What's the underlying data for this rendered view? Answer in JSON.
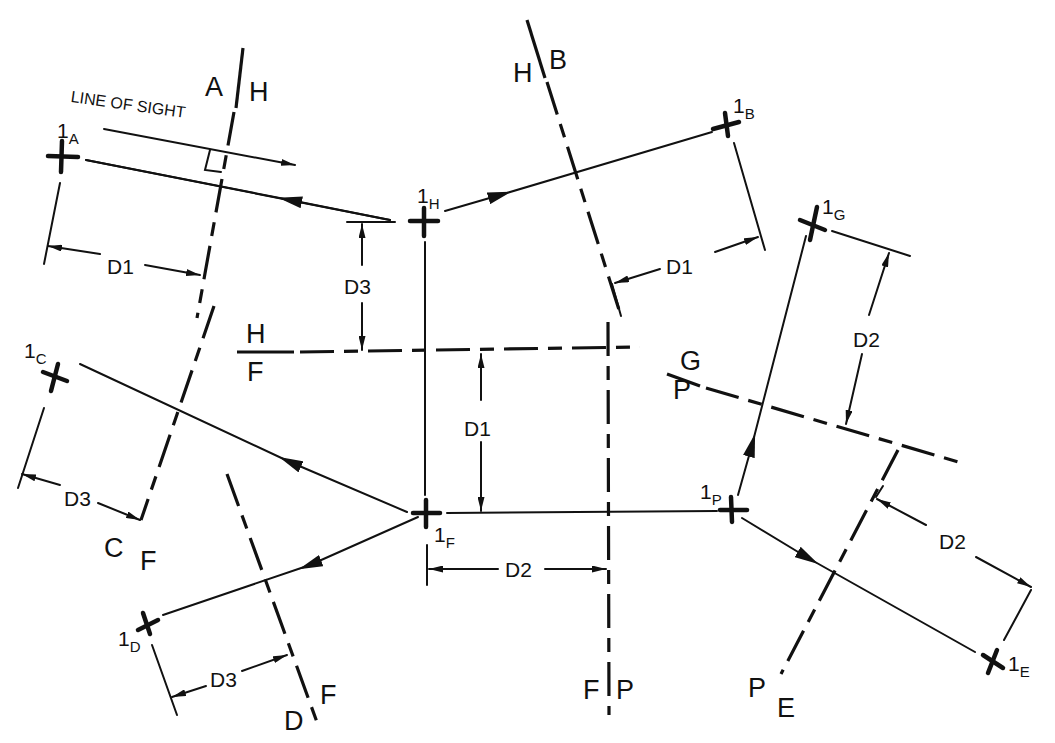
{
  "diagram": {
    "annotation": "LINE OF SIGHT",
    "fold_lines": [
      {
        "id": "A-H",
        "left": "A",
        "right": "H"
      },
      {
        "id": "H-B",
        "left": "H",
        "right": "B"
      },
      {
        "id": "H-F",
        "top": "H",
        "bottom": "F"
      },
      {
        "id": "C-F",
        "left": "C",
        "right": "F"
      },
      {
        "id": "D-F",
        "left": "D",
        "right": "F"
      },
      {
        "id": "F-P",
        "left": "F",
        "right": "P"
      },
      {
        "id": "G-P",
        "top": "G",
        "bottom": "P"
      },
      {
        "id": "P-E",
        "left": "P",
        "right": "E"
      }
    ],
    "points": [
      {
        "name": "1",
        "sub": "A"
      },
      {
        "name": "1",
        "sub": "H"
      },
      {
        "name": "1",
        "sub": "B"
      },
      {
        "name": "1",
        "sub": "G"
      },
      {
        "name": "1",
        "sub": "C"
      },
      {
        "name": "1",
        "sub": "F"
      },
      {
        "name": "1",
        "sub": "P"
      },
      {
        "name": "1",
        "sub": "D"
      },
      {
        "name": "1",
        "sub": "E"
      }
    ],
    "dimensions": [
      {
        "id": "dim-a",
        "label": "D1"
      },
      {
        "id": "dim-b",
        "label": "D1"
      },
      {
        "id": "dim-hf-top",
        "label": "D3"
      },
      {
        "id": "dim-hf-bottom",
        "label": "D1"
      },
      {
        "id": "dim-g",
        "label": "D2"
      },
      {
        "id": "dim-c",
        "label": "D3"
      },
      {
        "id": "dim-fp",
        "label": "D2"
      },
      {
        "id": "dim-d",
        "label": "D3"
      },
      {
        "id": "dim-e",
        "label": "D2"
      }
    ],
    "colors": {
      "ink": "#111111",
      "paper": "#ffffff"
    }
  }
}
